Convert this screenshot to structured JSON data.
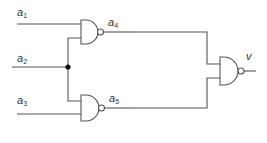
{
  "diagram": {
    "type": "logic-circuit",
    "inputs": [
      {
        "id": "a1",
        "base": "a",
        "sub": "1"
      },
      {
        "id": "a2",
        "base": "a",
        "sub": "2"
      },
      {
        "id": "a3",
        "base": "a",
        "sub": "3"
      }
    ],
    "intermediates": [
      {
        "id": "a4",
        "base": "a",
        "sub": "4"
      },
      {
        "id": "a5",
        "base": "a",
        "sub": "5"
      }
    ],
    "output": {
      "id": "v",
      "label": "v"
    },
    "gates": [
      {
        "id": "nand1",
        "type": "NAND",
        "inputs": [
          "a1",
          "a2"
        ],
        "output": "a4"
      },
      {
        "id": "nand2",
        "type": "NAND",
        "inputs": [
          "a2",
          "a3"
        ],
        "output": "a5"
      },
      {
        "id": "nand3",
        "type": "NAND",
        "inputs": [
          "a4",
          "a5"
        ],
        "output": "v"
      }
    ],
    "colors": {
      "wire": "#555555",
      "text": "#333333",
      "junction": "#111111"
    }
  }
}
